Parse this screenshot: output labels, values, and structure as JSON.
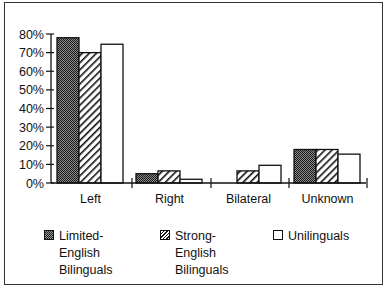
{
  "chart_data": {
    "type": "bar",
    "title": "",
    "xlabel": "",
    "ylabel": "",
    "ylim": [
      0,
      80
    ],
    "yticks": [
      "0%",
      "10%",
      "20%",
      "30%",
      "40%",
      "50%",
      "60%",
      "70%",
      "80%"
    ],
    "grid": false,
    "legend_position": "bottom",
    "categories": [
      "Left",
      "Right",
      "Bilateral",
      "Unknown"
    ],
    "series": [
      {
        "name": "Limited-English Bilinguals",
        "pattern": "dense-dither",
        "color": "#555555",
        "values": [
          78,
          5,
          0,
          18
        ]
      },
      {
        "name": "Strong-English Bilinguals",
        "pattern": "diagonal-hatch",
        "color": "#ffffff",
        "values": [
          70,
          6.5,
          6.5,
          18
        ]
      },
      {
        "name": "Unilinguals",
        "pattern": "solid",
        "color": "#ffffff",
        "values": [
          74.5,
          2,
          9.5,
          15.5
        ]
      }
    ]
  },
  "axis": {
    "y_tick_labels": [
      "0%",
      "10%",
      "20%",
      "30%",
      "40%",
      "50%",
      "60%",
      "70%",
      "80%"
    ],
    "x_labels": [
      "Left",
      "Right",
      "Bilateral",
      "Unknown"
    ]
  },
  "legend": {
    "items": [
      {
        "label": "Limited-English\nBilinguals"
      },
      {
        "label": "Strong-English\nBilinguals"
      },
      {
        "label": "Unilinguals"
      }
    ]
  }
}
